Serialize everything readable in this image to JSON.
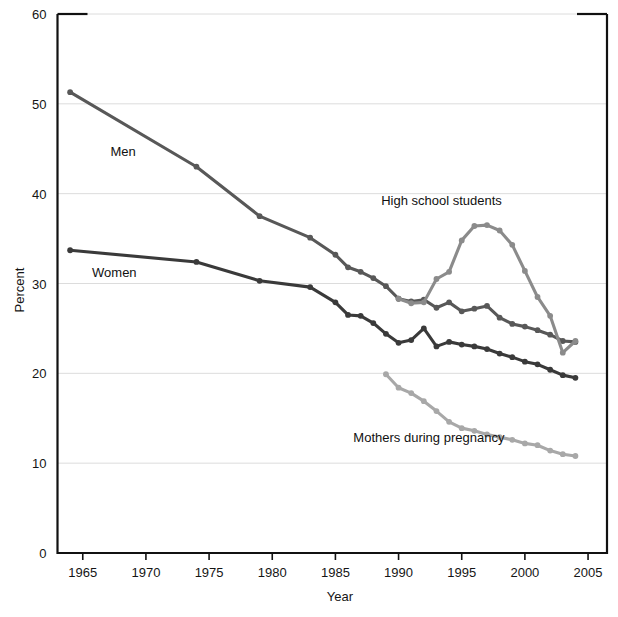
{
  "chart_data": {
    "type": "line",
    "title": "",
    "xlabel": "Year",
    "ylabel": "Percent",
    "xlim": [
      1963,
      2006.5
    ],
    "ylim": [
      0,
      60
    ],
    "xticks": [
      1965,
      1970,
      1975,
      1980,
      1985,
      1990,
      1995,
      2000,
      2005
    ],
    "xtick_labels": [
      "1965",
      "1970",
      "1975",
      "1980",
      "1985",
      "1990",
      "1995",
      "2000",
      "2005"
    ],
    "yticks": [
      0,
      10,
      20,
      30,
      40,
      50,
      60
    ],
    "ytick_labels": [
      "0",
      "10",
      "20",
      "30",
      "40",
      "50",
      "60"
    ],
    "grid": "horizontal-faint",
    "legend_position": "inline-annotations",
    "series": [
      {
        "name": "Men",
        "label": "Men",
        "color": "#585858",
        "label_x": 1968.2,
        "label_y": 44.2,
        "x": [
          1964,
          1974,
          1979,
          1983,
          1985,
          1986,
          1987,
          1988,
          1989,
          1990,
          1991,
          1992,
          1993,
          1994,
          1995,
          1996,
          1997,
          1998,
          1999,
          2000,
          2001,
          2002,
          2003,
          2004
        ],
        "y": [
          51.3,
          43.0,
          37.5,
          35.1,
          33.2,
          31.8,
          31.3,
          30.6,
          29.7,
          28.3,
          28.0,
          28.2,
          27.3,
          27.9,
          26.9,
          27.2,
          27.5,
          26.2,
          25.5,
          25.2,
          24.8,
          24.3,
          23.6,
          23.5
        ]
      },
      {
        "name": "Women",
        "label": "Women",
        "color": "#3a3a3a",
        "label_x": 1967.5,
        "label_y": 30.7,
        "x": [
          1964,
          1974,
          1979,
          1983,
          1985,
          1986,
          1987,
          1988,
          1989,
          1990,
          1991,
          1992,
          1993,
          1994,
          1995,
          1996,
          1997,
          1998,
          1999,
          2000,
          2001,
          2002,
          2003,
          2004
        ],
        "y": [
          33.7,
          32.4,
          30.3,
          29.6,
          27.9,
          26.5,
          26.4,
          25.6,
          24.4,
          23.4,
          23.7,
          25.0,
          23.0,
          23.5,
          23.2,
          23.0,
          22.7,
          22.2,
          21.8,
          21.3,
          21.0,
          20.4,
          19.8,
          19.5
        ]
      },
      {
        "name": "High school students",
        "label": "High school students",
        "color": "#8b8b8b",
        "label_x": 1993.4,
        "label_y": 38.7,
        "x": [
          1990,
          1991,
          1992,
          1993,
          1994,
          1995,
          1996,
          1997,
          1998,
          1999,
          2000,
          2001,
          2002,
          2003,
          2004
        ],
        "y": [
          28.3,
          27.8,
          27.9,
          30.5,
          31.3,
          34.8,
          36.4,
          36.5,
          35.9,
          34.3,
          31.4,
          28.5,
          26.4,
          22.3,
          23.6
        ]
      },
      {
        "name": "Mothers during pregnancy",
        "label": "Mothers during pregnancy",
        "color": "#a8a8a8",
        "label_x": 1992.4,
        "label_y": 12.4,
        "x": [
          1989,
          1990,
          1991,
          1992,
          1993,
          1994,
          1995,
          1996,
          1997,
          1998,
          1999,
          2000,
          2001,
          2002,
          2003,
          2004
        ],
        "y": [
          19.9,
          18.4,
          17.8,
          16.9,
          15.8,
          14.6,
          13.9,
          13.6,
          13.2,
          12.9,
          12.6,
          12.2,
          12.0,
          11.4,
          11.0,
          10.8
        ]
      }
    ]
  },
  "axes": {
    "y_title": "Percent",
    "x_title": "Year"
  }
}
